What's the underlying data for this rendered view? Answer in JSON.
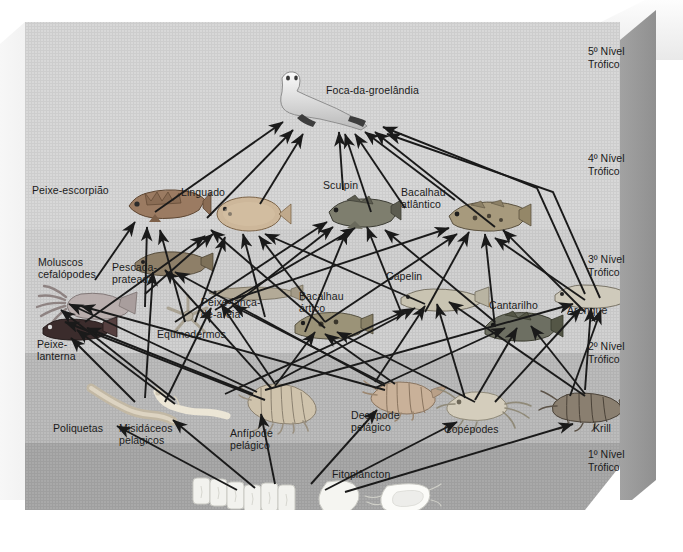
{
  "figure": {
    "kind": "marine-food-web-diagram",
    "title_visible": false
  },
  "trophic_levels": [
    {
      "id": "l5",
      "label": "5º Nível\nTrófico",
      "x": 600,
      "y": 45
    },
    {
      "id": "l4",
      "label": "4º Nível\nTrófico",
      "x": 600,
      "y": 145
    },
    {
      "id": "l3",
      "label": "3º Nível\nTrófico",
      "x": 600,
      "y": 248
    },
    {
      "id": "l2",
      "label": "2º Nível\nTrófico",
      "x": 600,
      "y": 344
    },
    {
      "id": "l1",
      "label": "1º Nível\nTrófico",
      "x": 600,
      "y": 452
    }
  ],
  "organisms": [
    {
      "id": "foca",
      "label": "Foca-da-groelândia",
      "label_x": 301,
      "label_y": 66,
      "sprite_x": 247,
      "sprite_y": 66,
      "level": 5
    },
    {
      "id": "peixe-escorpiao",
      "label": "Peixe-escorpião",
      "label_x": 27,
      "label_y": 166,
      "sprite_x": 112,
      "sprite_y": 172,
      "level": 4
    },
    {
      "id": "linguado",
      "label": "Linguado",
      "label_x": 176,
      "label_y": 168,
      "sprite_x": 186,
      "sprite_y": 178,
      "level": 4
    },
    {
      "id": "sculpin",
      "label": "Sculpin",
      "label_x": 318,
      "label_y": 161,
      "sprite_x": 315,
      "sprite_y": 178,
      "level": 4
    },
    {
      "id": "bacalhau-atlantico",
      "label": "Bacalhau\natlântico",
      "label_x": 396,
      "label_y": 168,
      "sprite_x": 437,
      "sprite_y": 182,
      "level": 4
    },
    {
      "id": "moluscos",
      "label": "Moluscos\ncefalópodes",
      "label_x": 33,
      "label_y": 238,
      "sprite_x": 18,
      "sprite_y": 272,
      "level": 3
    },
    {
      "id": "pescada",
      "label": "Pescada-\nprateada",
      "label_x": 107,
      "label_y": 243,
      "sprite_x": 112,
      "sprite_y": 236,
      "level": 3
    },
    {
      "id": "peixe-lance",
      "label": "Peixe-lança-\nde-areia",
      "label_x": 196,
      "label_y": 278,
      "sprite_x": 188,
      "sprite_y": 272,
      "level": 3
    },
    {
      "id": "equinodermos",
      "label": "Equinodermos",
      "label_x": 152,
      "label_y": 310,
      "sprite_x": 146,
      "sprite_y": 280,
      "level": 3
    },
    {
      "id": "bacalhau-artico",
      "label": "Bacalhau\nártico",
      "label_x": 294,
      "label_y": 272,
      "sprite_x": 277,
      "sprite_y": 296,
      "level": 3
    },
    {
      "id": "capelin",
      "label": "Capelin",
      "label_x": 381,
      "label_y": 252,
      "sprite_x": 388,
      "sprite_y": 272,
      "level": 3
    },
    {
      "id": "cantarilho",
      "label": "Cantarilho",
      "label_x": 484,
      "label_y": 281,
      "sprite_x": 470,
      "sprite_y": 296,
      "level": 3
    },
    {
      "id": "arenque",
      "label": "Arenque",
      "label_x": 562,
      "label_y": 286,
      "sprite_x": 546,
      "sprite_y": 268,
      "level": 3
    },
    {
      "id": "peixe-lanterna",
      "label": "Peixe-\nlanterna",
      "label_x": 32,
      "label_y": 320,
      "sprite_x": 22,
      "sprite_y": 300,
      "level": 3
    },
    {
      "id": "poliquetas",
      "label": "Poliquetas",
      "label_x": 48,
      "label_y": 404,
      "sprite_x": 76,
      "sprite_y": 372,
      "level": 2
    },
    {
      "id": "misidaceos",
      "label": "Misidáceos\npelágicos",
      "label_x": 114,
      "label_y": 404,
      "sprite_x": 132,
      "sprite_y": 375,
      "level": 2
    },
    {
      "id": "anfipode",
      "label": "Anfípode\npelágico",
      "label_x": 225,
      "label_y": 409,
      "sprite_x": 232,
      "sprite_y": 374,
      "level": 2
    },
    {
      "id": "decapode",
      "label": "Decápode\npelágico",
      "label_x": 346,
      "label_y": 391,
      "sprite_x": 355,
      "sprite_y": 368,
      "level": 2
    },
    {
      "id": "copepodes",
      "label": "Copépodes",
      "label_x": 439,
      "label_y": 405,
      "sprite_x": 432,
      "sprite_y": 382,
      "level": 2
    },
    {
      "id": "krill",
      "label": "Krill",
      "label_x": 588,
      "label_y": 404,
      "sprite_x": 540,
      "sprite_y": 376,
      "level": 2
    },
    {
      "id": "fitoplancton",
      "label": "Fitoplâncton",
      "label_x": 327,
      "label_y": 450,
      "sprite_x": 192,
      "sprite_y": 474,
      "level": 1
    }
  ],
  "colors": {
    "background_page": "#ffffff",
    "band_level5": "#d9d9d9",
    "band_level4": "#d2d2d2",
    "band_level3": "#bcbcbc",
    "band_level2": "#a9a9a9",
    "box_side": "#9a9a9a",
    "arrow": "#1a1a1a",
    "text": "#1b1b1b"
  }
}
